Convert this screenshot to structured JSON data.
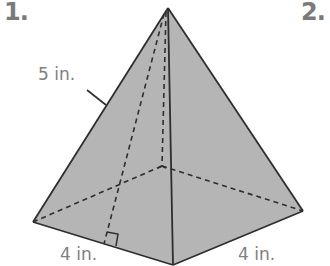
{
  "problems": [
    {
      "number": "1."
    },
    {
      "number": "2."
    }
  ],
  "figure": {
    "shape": "square pyramid",
    "fill_color": "#b5b5b5",
    "edge_color": "#2e2e2e",
    "labels": {
      "slant_height": "5 in.",
      "base_left": "4 in.",
      "base_right": "4 in."
    }
  }
}
